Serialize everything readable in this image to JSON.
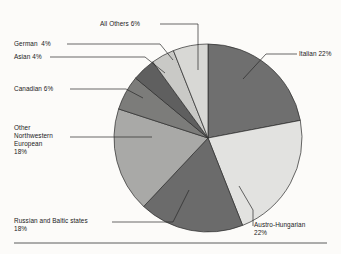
{
  "figure": {
    "background_color": "#fcfbf9",
    "rule_color": "#4a4a4a"
  },
  "chart_data": {
    "type": "pie",
    "title": "",
    "subtitle": "",
    "xlabel": "",
    "ylabel": "",
    "legend_position": "none",
    "grid": false,
    "labels_with_leader_lines": true,
    "total_percent": 100,
    "start_angle_deg": 0,
    "direction": "clockwise",
    "categories": [
      "Italian",
      "Austro-Hungarian",
      "Russian and Baltic states",
      "Other Northwestern European",
      "Canadian",
      "Asian",
      "German",
      "All Others"
    ],
    "values": [
      22,
      22,
      18,
      18,
      6,
      4,
      4,
      6
    ],
    "colors": [
      "#6f6f6f",
      "#e2e2e0",
      "#6b6b6b",
      "#a9a9a7",
      "#7c7c7a",
      "#5f5f5f",
      "#c9c9c6",
      "#d8d8d5"
    ],
    "slices": [
      {
        "name": "Italian",
        "value": 22,
        "label": "Italian 22%",
        "color": "#6f6f6f"
      },
      {
        "name": "Austro-Hungarian",
        "value": 22,
        "label": "Austro-Hungarian\n22%",
        "color": "#e2e2e0"
      },
      {
        "name": "Russian and Baltic states",
        "value": 18,
        "label": "Russian and Baltic states\n18%",
        "color": "#6b6b6b"
      },
      {
        "name": "Other Northwestern European",
        "value": 18,
        "label": "Other\nNorthwestern\nEuropean\n18%",
        "color": "#a9a9a7"
      },
      {
        "name": "Canadian",
        "value": 6,
        "label": "Canadian 6%",
        "color": "#7c7c7a"
      },
      {
        "name": "Asian",
        "value": 4,
        "label": "Asian 4%",
        "color": "#5f5f5f"
      },
      {
        "name": "German",
        "value": 4,
        "label": "German  4%",
        "color": "#c9c9c6"
      },
      {
        "name": "All Others",
        "value": 6,
        "label": "All Others 6%",
        "color": "#d8d8d5"
      }
    ]
  },
  "labels": {
    "italian": "Italian 22%",
    "austro_hungarian_line1": "Austro-Hungarian",
    "austro_hungarian_line2": "22%",
    "russian_baltic_line1": "Russian and Baltic states",
    "russian_baltic_line2": "18%",
    "other_nw_european_line1": "Other",
    "other_nw_european_line2": "Northwestern",
    "other_nw_european_line3": "European",
    "other_nw_european_line4": "18%",
    "canadian": "Canadian 6%",
    "asian": "Asian 4%",
    "german": "German  4%",
    "all_others": "All Others 6%"
  }
}
